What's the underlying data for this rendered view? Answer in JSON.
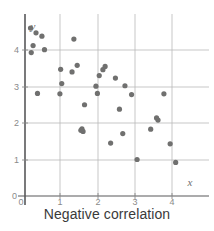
{
  "caption": "Negative correlation",
  "colors": {
    "point": "#70706f",
    "axis": "#58585a",
    "grid": "#b9b9b9",
    "tick_text": "#8a8a8a",
    "caption_text": "#3a3a3a",
    "background": "#ffffff"
  },
  "axis_labels": {
    "x": "x",
    "y": "y"
  },
  "chart_data": {
    "type": "scatter",
    "title": "Negative correlation",
    "xlabel": "x",
    "ylabel": "y",
    "xlim": [
      0,
      4.9
    ],
    "ylim": [
      0,
      4.8
    ],
    "xticks": [
      0,
      1,
      2,
      3,
      4
    ],
    "yticks": [
      0,
      1,
      2,
      3,
      4
    ],
    "xtick_labels": [
      "0",
      "1",
      "2",
      "3",
      "4"
    ],
    "ytick_labels": [
      "0",
      "1",
      "2",
      "3",
      "4"
    ],
    "grid": true,
    "legend": false,
    "correlation": "negative",
    "point_count": 35,
    "points": [
      [
        0.15,
        4.6
      ],
      [
        0.3,
        4.47
      ],
      [
        0.22,
        4.12
      ],
      [
        0.17,
        3.93
      ],
      [
        0.46,
        4.38
      ],
      [
        0.53,
        4.01
      ],
      [
        0.34,
        2.81
      ],
      [
        1.0,
        3.08
      ],
      [
        0.97,
        3.47
      ],
      [
        0.95,
        2.8
      ],
      [
        1.33,
        4.3
      ],
      [
        1.28,
        3.4
      ],
      [
        1.42,
        3.58
      ],
      [
        1.62,
        2.5
      ],
      [
        1.55,
        1.84
      ],
      [
        1.58,
        1.77
      ],
      [
        1.52,
        1.8
      ],
      [
        2.02,
        3.3
      ],
      [
        2.18,
        3.55
      ],
      [
        2.12,
        3.46
      ],
      [
        1.97,
        2.81
      ],
      [
        1.93,
        3.01
      ],
      [
        2.46,
        3.23
      ],
      [
        2.66,
        1.71
      ],
      [
        2.57,
        2.38
      ],
      [
        2.33,
        1.45
      ],
      [
        3.05,
        1.0
      ],
      [
        3.42,
        1.83
      ],
      [
        3.58,
        2.14
      ],
      [
        3.62,
        2.08
      ],
      [
        3.78,
        2.8
      ],
      [
        3.95,
        1.43
      ],
      [
        4.1,
        0.92
      ],
      [
        2.9,
        2.78
      ],
      [
        2.72,
        3.02
      ]
    ]
  }
}
